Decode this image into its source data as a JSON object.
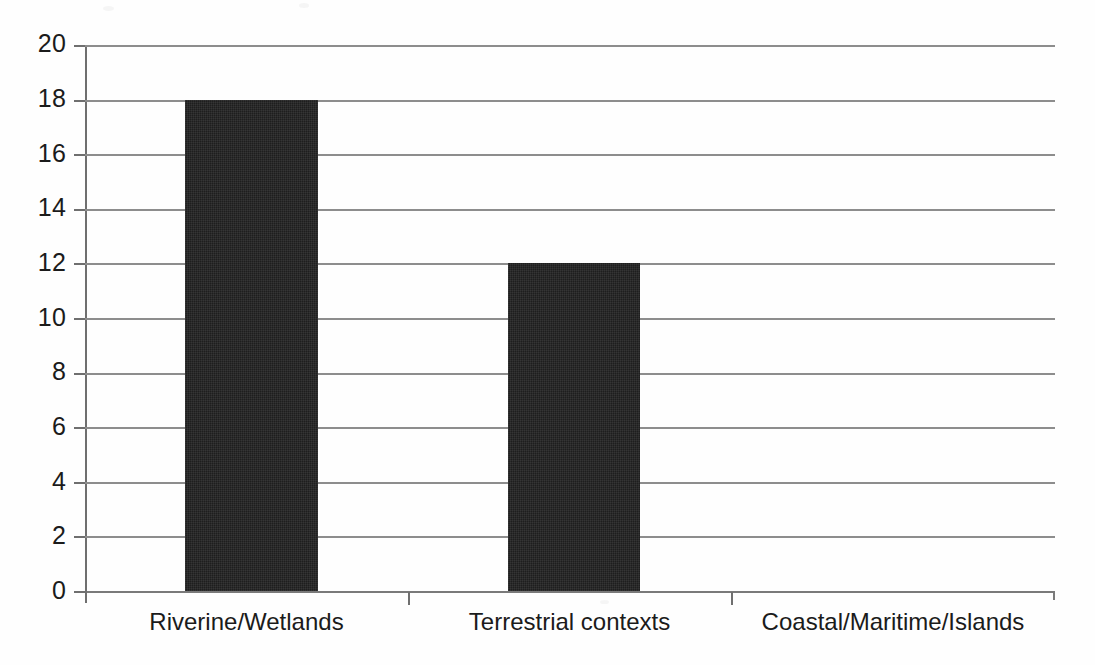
{
  "chart_data": {
    "type": "bar",
    "title": "",
    "subtitle": "",
    "xlabel": "",
    "ylabel": "",
    "categories": [
      "Riverine/Wetlands",
      "Terrestrial contexts",
      "Coastal/Maritime/Islands"
    ],
    "values": [
      18,
      12,
      0
    ],
    "series": [
      {
        "name": "Count",
        "values": [
          18,
          12,
          0
        ]
      }
    ],
    "ylim": [
      0,
      20
    ],
    "ytick_values": [
      0,
      2,
      4,
      6,
      8,
      10,
      12,
      14,
      16,
      18,
      20
    ],
    "ytick_labels": [
      "0",
      "2",
      "4",
      "6",
      "8",
      "10",
      "12",
      "14",
      "16",
      "18",
      "20"
    ],
    "ytick_interval": 2,
    "grid": {
      "horizontal": true,
      "vertical": false
    },
    "legend": {
      "visible": false,
      "position": "none",
      "entries": []
    },
    "annotations": [],
    "colors": {
      "bar_fill": "#1e1e1e",
      "gridline": "#8d8d8d",
      "axis": "#6f6f6f",
      "text": "#1b1b1b",
      "background": "#fefefe"
    }
  }
}
